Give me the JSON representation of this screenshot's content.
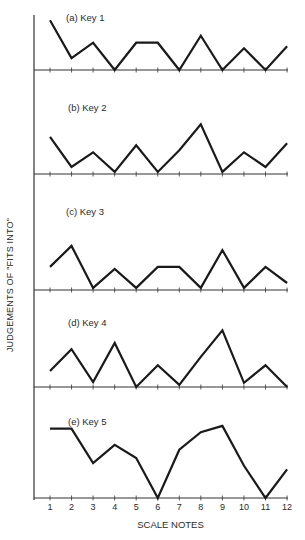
{
  "chart_data": {
    "type": "line",
    "title": "",
    "xlabel": "SCALE NOTES",
    "ylabel": "JUDGEMENTS OF \"FITS INTO\"",
    "categories": [
      "1",
      "2",
      "3",
      "4",
      "5",
      "6",
      "7",
      "8",
      "9",
      "10",
      "11",
      "12"
    ],
    "grid": false,
    "legend": "none",
    "panels": [
      {
        "label": "(a) Key 1",
        "values": [
          7.1,
          1.7,
          3.9,
          0,
          3.9,
          3.9,
          0,
          4.9,
          0,
          3.1,
          0,
          3.4
        ]
      },
      {
        "label": "(b) Key 2",
        "values": [
          5.3,
          1.0,
          3.1,
          0.3,
          4.1,
          0.3,
          3.4,
          7.1,
          0.3,
          3.1,
          1.0,
          4.4
        ]
      },
      {
        "label": "(c) Key 3",
        "values": [
          3.3,
          6.3,
          0.3,
          3.0,
          0.3,
          3.3,
          3.3,
          0.3,
          5.7,
          0.3,
          3.3,
          1.0
        ]
      },
      {
        "label": "(d) Key 4",
        "values": [
          2.3,
          5.4,
          0.7,
          6.3,
          0,
          3.1,
          0.3,
          4.3,
          8.1,
          0.6,
          3.1,
          0
        ]
      },
      {
        "label": "(e) Key 5",
        "values": [
          9.9,
          9.9,
          5.0,
          7.6,
          5.7,
          0,
          6.9,
          9.4,
          10.3,
          4.6,
          0,
          4.1
        ]
      }
    ]
  },
  "labels": {
    "xlabel": "SCALE NOTES",
    "ylabel": "JUDGEMENTS OF \"FITS INTO\"",
    "panel_a": "(a) Key 1",
    "panel_b": "(b) Key 2",
    "panel_c": "(c) Key 3",
    "panel_d": "(d) Key 4",
    "panel_e": "(e) Key 5",
    "ticks": [
      "1",
      "2",
      "3",
      "4",
      "5",
      "6",
      "7",
      "8",
      "9",
      "10",
      "11",
      "12"
    ]
  },
  "style": {
    "line_color": "#1a1a1a",
    "axis_color": "#333333"
  }
}
